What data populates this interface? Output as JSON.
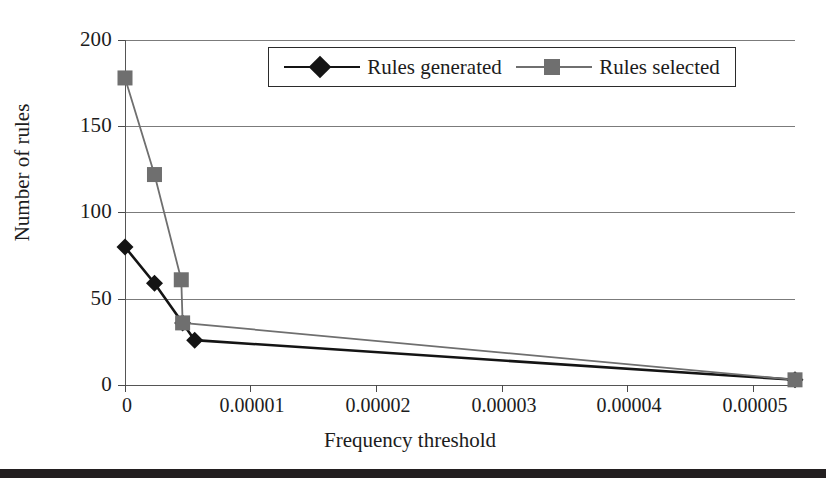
{
  "chart_data": {
    "type": "line",
    "title": "",
    "xlabel": "Frequency threshold",
    "ylabel": "Number of rules",
    "xlim": [
      0,
      5e-05
    ],
    "ylim": [
      0,
      200
    ],
    "grid": true,
    "legend_position": "top-center",
    "x_ticks": [
      "0",
      "0.00001",
      "0.00002",
      "0.00003",
      "0.00004",
      "0.00005"
    ],
    "x_tick_values": [
      0,
      1e-05,
      2e-05,
      3e-05,
      4e-05,
      5e-05
    ],
    "y_ticks": [
      "0",
      "50",
      "100",
      "150",
      "200"
    ],
    "y_tick_values": [
      0,
      50,
      100,
      150,
      200
    ],
    "series": [
      {
        "name": "Rules generated",
        "color": "#141414",
        "marker": "diamond",
        "x": [
          0,
          2.2e-06,
          4.3e-06,
          5.2e-06,
          5e-05
        ],
        "y": [
          80,
          59,
          36,
          26,
          3
        ]
      },
      {
        "name": "Rules selected",
        "color": "#6f6f6f",
        "marker": "square",
        "x": [
          0,
          2.2e-06,
          4.2e-06,
          4.3e-06,
          5e-05
        ],
        "y": [
          178,
          122,
          61,
          36,
          3
        ]
      }
    ]
  },
  "legend": {
    "entries": [
      {
        "label": "Rules generated",
        "marker": "diamond-marker",
        "color": "#141414"
      },
      {
        "label": "Rules selected",
        "marker": "square-marker",
        "color": "#6f6f6f"
      }
    ]
  },
  "axes": {
    "x_title": "Frequency threshold",
    "y_title": "Number of rules",
    "x_tick_labels": [
      "0",
      "0.00001",
      "0.00002",
      "0.00003",
      "0.00004",
      "0.00005"
    ],
    "y_tick_labels": [
      "200",
      "150",
      "100",
      "50",
      "0"
    ]
  },
  "colors": {
    "series_generated": "#141414",
    "series_selected": "#6f6f6f",
    "gridline": "#7b7b7b",
    "text": "#1c1c1c",
    "rule": "#231f20",
    "background": "#ffffff"
  }
}
